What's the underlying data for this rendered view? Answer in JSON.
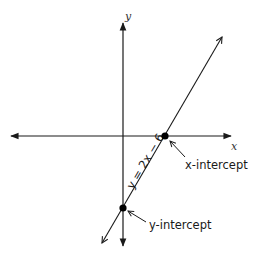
{
  "diagram": {
    "axes": {
      "x_label": "x",
      "y_label": "y"
    },
    "line": {
      "equation_label": "y = 2x − 6",
      "slope": 2,
      "intercept": -6
    },
    "points": [
      {
        "name": "x-intercept",
        "label": "x-intercept",
        "coords": [
          3,
          0
        ]
      },
      {
        "name": "y-intercept",
        "label": "y-intercept",
        "coords": [
          0,
          -6
        ]
      }
    ],
    "colors": {
      "line": "#1a1a1a",
      "axis": "#1a1a1a",
      "point": "#000000",
      "background": "#ffffff"
    }
  }
}
